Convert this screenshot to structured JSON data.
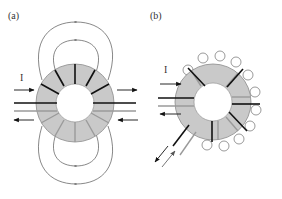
{
  "panels": [
    {
      "id": "a",
      "label": "(a)",
      "current_label": "I",
      "description": "Toroid with windings concentrated on two halves; external field loops above and below"
    },
    {
      "id": "b",
      "label": "(b)",
      "current_label": "I",
      "description": "Toroid with windings distributed around; small field loops around outer edge; leads exiting diagonally"
    }
  ],
  "colors": {
    "core_fill": "#c9c9c9",
    "core_stroke": "#8a8a8a",
    "winding_dark": "#111111",
    "winding_light": "#9a9a9a",
    "field_line": "#555555",
    "arrow": "#111111"
  }
}
